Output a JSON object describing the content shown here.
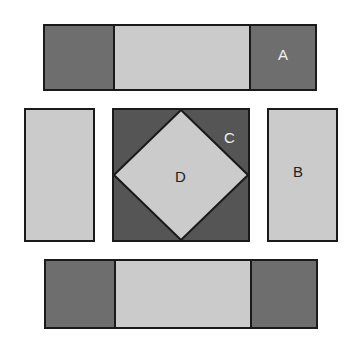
{
  "colors": {
    "dark": "#6e6e6e",
    "light": "#cbcbcb",
    "center_dark": "#555555",
    "outline": "#1a1a1a",
    "label_light": "#f0f0f0",
    "label_dark": "#222222"
  },
  "labels": {
    "a": "A",
    "b": "B",
    "c": "C",
    "d": "D"
  },
  "pieces": [
    {
      "id": "top-strip",
      "segments": [
        "dark",
        "light",
        "dark"
      ],
      "label": "A"
    },
    {
      "id": "left-rect",
      "fill": "light"
    },
    {
      "id": "center-block",
      "outer": "center_dark",
      "diamond": "light",
      "labels": [
        "C",
        "D"
      ]
    },
    {
      "id": "right-rect",
      "fill": "light",
      "label": "B"
    },
    {
      "id": "bottom-strip",
      "segments": [
        "dark",
        "light",
        "dark"
      ]
    }
  ]
}
